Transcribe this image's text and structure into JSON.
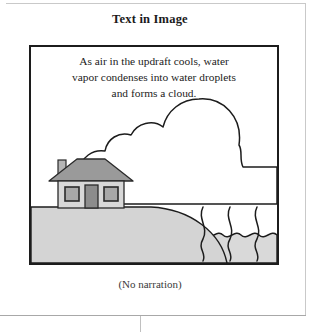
{
  "page": {
    "title": "Text in Image",
    "caption": "(No narration)"
  },
  "illustration": {
    "name": "cloud-formation-diagram",
    "overlay_text_lines": [
      "As air in the updraft cools, water",
      "vapor condenses into water droplets",
      "and forms a cloud."
    ],
    "overlay_text_full": "As air in the updraft cools, water vapor condenses into water droplets and forms a cloud.",
    "elements": [
      "cloud",
      "updraft-lines",
      "water",
      "ground-hill",
      "house"
    ]
  },
  "colors": {
    "frame_stroke": "#1c1c1c",
    "sky_fill": "#ffffff",
    "cloud_fill": "#ffffff",
    "cloud_stroke": "#1c1c1c",
    "ground_fill": "#d4d4d4",
    "ground_stroke": "#1c1c1c",
    "water_fill": "#d9d9d9",
    "water_stroke": "#1c1c1c",
    "house_wall": "#d8d8d8",
    "house_roof": "#9a9a9a",
    "house_door": "#8c8c8c",
    "house_window": "#a8a8a8",
    "house_stroke": "#2a2a2a",
    "text": "#1b1b1b",
    "cell_border": "#c9c9c9"
  }
}
